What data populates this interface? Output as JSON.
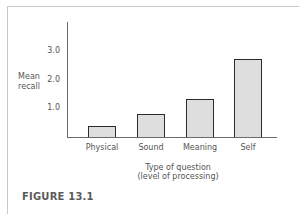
{
  "figure": {
    "caption": "FIGURE 13.1"
  },
  "axes": {
    "ylabel_line1": "Mean",
    "ylabel_line2": "recall",
    "yticks": [
      "1.0",
      "2.0",
      "3.0"
    ],
    "xlabel_line1": "Type of question",
    "xlabel_line2": "(level of processing)"
  },
  "chart_data": {
    "type": "bar",
    "title": "",
    "categories": [
      "Physical",
      "Sound",
      "Meaning",
      "Self"
    ],
    "values": [
      0.4,
      0.8,
      1.35,
      2.75
    ],
    "xlabel": "Type of question (level of processing)",
    "ylabel": "Mean recall",
    "ylim": [
      0,
      4.0
    ],
    "yticks": [
      1.0,
      2.0,
      3.0
    ],
    "grid": false,
    "legend": null,
    "bar_fill": "#dedede",
    "bar_edge": "#2b2b2b",
    "caption": "FIGURE 13.1"
  }
}
